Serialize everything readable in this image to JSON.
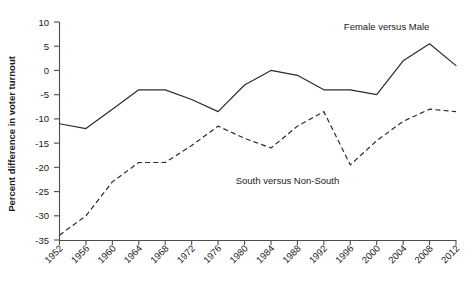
{
  "chart_data": {
    "type": "line",
    "title": "",
    "xlabel": "",
    "ylabel": "Percent difference in voter turnout",
    "x": [
      1952,
      1956,
      1960,
      1964,
      1968,
      1972,
      1976,
      1980,
      1984,
      1988,
      1992,
      1996,
      2000,
      2004,
      2008,
      2012
    ],
    "xtick_labels": [
      "1952",
      "1956",
      "1960",
      "1964",
      "1968",
      "1972",
      "1976",
      "1980",
      "1984",
      "1988",
      "1992",
      "1996",
      "2000",
      "2004",
      "2008",
      "2012"
    ],
    "ytick_labels": [
      "10",
      "5",
      "0",
      "-5",
      "-10",
      "-15",
      "-20",
      "-25",
      "-30",
      "-35"
    ],
    "yticks": [
      10,
      5,
      0,
      -5,
      -10,
      -15,
      -20,
      -25,
      -30,
      -35
    ],
    "ylim": [
      -35,
      10
    ],
    "xlim": [
      1952,
      2012
    ],
    "grid": false,
    "legend": "inline-annotations",
    "series": [
      {
        "name": "Female versus Male",
        "style": "solid",
        "label_position": "upper-right",
        "values": [
          -11,
          -12,
          -8,
          -4,
          -4,
          -6,
          -8.5,
          -3,
          0,
          -1,
          -4,
          -4,
          -5,
          2,
          5.5,
          1
        ]
      },
      {
        "name": "South versus Non-South",
        "style": "dashed",
        "label_position": "middle-right",
        "values": [
          -34,
          -30,
          -23,
          -19,
          -19,
          -15.5,
          -11.5,
          -14,
          -16,
          -11.5,
          -8.5,
          -19.5,
          -14.5,
          -10.5,
          -8,
          -8.5
        ]
      }
    ],
    "annotations": [
      {
        "text": "Female versus Male",
        "x": 2001.5,
        "y": 8.4
      },
      {
        "text": "South versus Non-South",
        "x": 1986.5,
        "y": -23.5
      }
    ]
  }
}
